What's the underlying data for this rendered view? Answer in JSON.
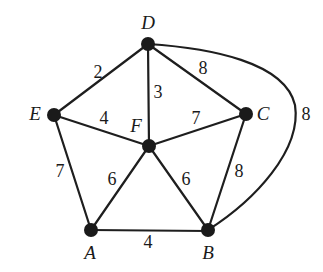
{
  "diagram": {
    "type": "weighted-undirected-graph",
    "nodes": [
      {
        "id": "D",
        "label": "D",
        "x": 148,
        "y": 44,
        "label_x": 148,
        "label_y": 29
      },
      {
        "id": "E",
        "label": "E",
        "x": 54,
        "y": 115,
        "label_x": 35,
        "label_y": 120
      },
      {
        "id": "C",
        "label": "C",
        "x": 246,
        "y": 114,
        "label_x": 263,
        "label_y": 120
      },
      {
        "id": "F",
        "label": "F",
        "x": 149,
        "y": 146,
        "label_x": 136,
        "label_y": 132
      },
      {
        "id": "A",
        "label": "A",
        "x": 91,
        "y": 230,
        "label_x": 90,
        "label_y": 259
      },
      {
        "id": "B",
        "label": "B",
        "x": 208,
        "y": 230,
        "label_x": 208,
        "label_y": 259
      }
    ],
    "edges": [
      {
        "from": "D",
        "to": "E",
        "weight": "2",
        "label_x": 98,
        "label_y": 78
      },
      {
        "from": "D",
        "to": "F",
        "weight": "3",
        "label_x": 158,
        "label_y": 98
      },
      {
        "from": "D",
        "to": "C",
        "weight": "8",
        "label_x": 203,
        "label_y": 74
      },
      {
        "from": "E",
        "to": "F",
        "weight": "4",
        "label_x": 104,
        "label_y": 124
      },
      {
        "from": "F",
        "to": "C",
        "weight": "7",
        "label_x": 196,
        "label_y": 124
      },
      {
        "from": "E",
        "to": "A",
        "weight": "7",
        "label_x": 60,
        "label_y": 177
      },
      {
        "from": "F",
        "to": "A",
        "weight": "6",
        "label_x": 112,
        "label_y": 185
      },
      {
        "from": "F",
        "to": "B",
        "weight": "6",
        "label_x": 186,
        "label_y": 185
      },
      {
        "from": "C",
        "to": "B",
        "weight": "8",
        "label_x": 239,
        "label_y": 177
      },
      {
        "from": "A",
        "to": "B",
        "weight": "4",
        "label_x": 148,
        "label_y": 248
      },
      {
        "from": "D",
        "to": "B",
        "weight": "8",
        "curved": true,
        "label_x": 306,
        "label_y": 120
      }
    ]
  }
}
